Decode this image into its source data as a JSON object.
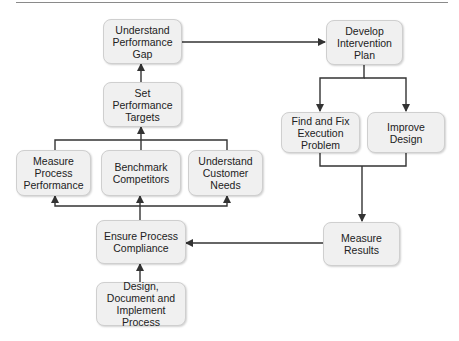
{
  "diagram": {
    "nodes": {
      "understand_gap": "Understand Performance Gap",
      "set_targets": "Set Performance Targets",
      "measure_process": "Measure Process Performance",
      "benchmark": "Benchmark Competitors",
      "customer_needs": "Understand Customer Needs",
      "ensure_compliance": "Ensure Process Compliance",
      "design_process": "Design, Document and Implement Process",
      "develop_plan": "Develop Intervention Plan",
      "fix_execution": "Find and Fix Execution Problem",
      "improve_design": "Improve Design",
      "measure_results": "Measure Results"
    },
    "edges": [
      [
        "design_process",
        "ensure_compliance"
      ],
      [
        "ensure_compliance",
        "measure_process"
      ],
      [
        "ensure_compliance",
        "benchmark"
      ],
      [
        "ensure_compliance",
        "customer_needs"
      ],
      [
        "measure_process",
        "set_targets"
      ],
      [
        "benchmark",
        "set_targets"
      ],
      [
        "customer_needs",
        "set_targets"
      ],
      [
        "set_targets",
        "understand_gap"
      ],
      [
        "understand_gap",
        "develop_plan"
      ],
      [
        "develop_plan",
        "fix_execution"
      ],
      [
        "develop_plan",
        "improve_design"
      ],
      [
        "fix_execution",
        "measure_results"
      ],
      [
        "improve_design",
        "measure_results"
      ],
      [
        "measure_results",
        "ensure_compliance"
      ]
    ]
  }
}
